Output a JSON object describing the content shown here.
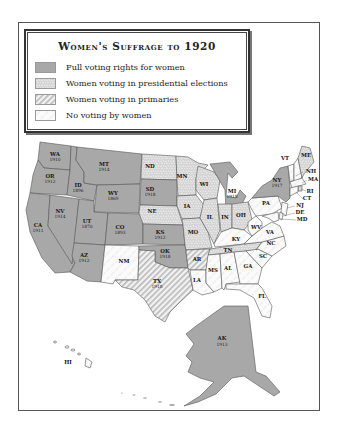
{
  "legend": {
    "title": "Women's Suffrage to 1920",
    "items": [
      {
        "key": "full",
        "label": "Full voting rights for women",
        "color": "#a8a8a8"
      },
      {
        "key": "presidential",
        "label": "Women voting in presidential elections",
        "color": "#cfcfcf"
      },
      {
        "key": "primaries",
        "label": "Women voting in primaries",
        "color": "#e4e4e4"
      },
      {
        "key": "none",
        "label": "No voting by women",
        "color": "#f4f4f4"
      }
    ]
  },
  "states": {
    "WA": {
      "abbr": "WA",
      "year": "1910",
      "status": "full"
    },
    "OR": {
      "abbr": "OR",
      "year": "1912",
      "status": "full"
    },
    "CA": {
      "abbr": "CA",
      "year": "1911",
      "status": "full"
    },
    "ID": {
      "abbr": "ID",
      "year": "1896",
      "status": "full"
    },
    "NV": {
      "abbr": "NV",
      "year": "1914",
      "status": "full"
    },
    "MT": {
      "abbr": "MT",
      "year": "1914",
      "status": "full"
    },
    "WY": {
      "abbr": "WY",
      "year": "1869",
      "status": "full"
    },
    "UT": {
      "abbr": "UT",
      "year": "1870",
      "status": "full"
    },
    "AZ": {
      "abbr": "AZ",
      "year": "1912",
      "status": "full"
    },
    "CO": {
      "abbr": "CO",
      "year": "1893",
      "status": "full"
    },
    "NM": {
      "abbr": "NM",
      "status": "none"
    },
    "ND": {
      "abbr": "ND",
      "status": "presidential"
    },
    "SD": {
      "abbr": "SD",
      "year": "1918",
      "status": "full"
    },
    "NE": {
      "abbr": "NE",
      "status": "presidential"
    },
    "KS": {
      "abbr": "KS",
      "year": "1912",
      "status": "full"
    },
    "OK": {
      "abbr": "OK",
      "year": "1918",
      "status": "full"
    },
    "TX": {
      "abbr": "TX",
      "year": "1918",
      "status": "primaries"
    },
    "MN": {
      "abbr": "MN",
      "status": "presidential"
    },
    "IA": {
      "abbr": "IA",
      "status": "presidential"
    },
    "MO": {
      "abbr": "MO",
      "status": "presidential"
    },
    "AR": {
      "abbr": "AR",
      "status": "primaries"
    },
    "LA": {
      "abbr": "LA",
      "status": "none"
    },
    "WI": {
      "abbr": "WI",
      "status": "presidential"
    },
    "IL": {
      "abbr": "IL",
      "status": "presidential"
    },
    "MI": {
      "abbr": "MI",
      "year": "1918",
      "status": "full"
    },
    "IN": {
      "abbr": "IN",
      "status": "presidential"
    },
    "OH": {
      "abbr": "OH",
      "status": "presidential"
    },
    "KY": {
      "abbr": "KY",
      "status": "none"
    },
    "TN": {
      "abbr": "TN",
      "status": "presidential"
    },
    "MS": {
      "abbr": "MS",
      "status": "none"
    },
    "AL": {
      "abbr": "AL",
      "status": "none"
    },
    "GA": {
      "abbr": "GA",
      "status": "none"
    },
    "FL": {
      "abbr": "FL",
      "status": "none"
    },
    "SC": {
      "abbr": "SC",
      "status": "none"
    },
    "NC": {
      "abbr": "NC",
      "status": "none"
    },
    "VA": {
      "abbr": "VA",
      "status": "none"
    },
    "WV": {
      "abbr": "WV",
      "status": "none"
    },
    "PA": {
      "abbr": "PA",
      "status": "none"
    },
    "NY": {
      "abbr": "NY",
      "year": "1917",
      "status": "full"
    },
    "VT": {
      "abbr": "VT",
      "status": "none"
    },
    "NH": {
      "abbr": "NH",
      "status": "none"
    },
    "ME": {
      "abbr": "ME",
      "status": "presidential"
    },
    "MA": {
      "abbr": "MA",
      "status": "none"
    },
    "RI": {
      "abbr": "RI",
      "status": "presidential"
    },
    "CT": {
      "abbr": "CT",
      "status": "none"
    },
    "NJ": {
      "abbr": "NJ",
      "status": "none"
    },
    "DE": {
      "abbr": "DE",
      "status": "none"
    },
    "MD": {
      "abbr": "MD",
      "status": "none"
    },
    "AK": {
      "abbr": "AK",
      "year": "1913",
      "status": "full"
    },
    "HI": {
      "abbr": "HI",
      "status": "none"
    }
  }
}
